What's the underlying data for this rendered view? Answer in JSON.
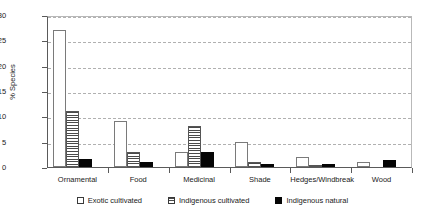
{
  "chart_data": {
    "type": "bar",
    "title": "",
    "xlabel": "",
    "ylabel": "% Species",
    "ylim": [
      0,
      30
    ],
    "ytick_step": 5,
    "yticks": [
      "0",
      "5",
      "10",
      "15",
      "20",
      "25",
      "30"
    ],
    "grid": "horizontal-dashed",
    "legend_position": "bottom-center",
    "categories": [
      "Ornamental",
      "Food",
      "Medicinal",
      "Shade",
      "Hedges/Windbreak",
      "Wood"
    ],
    "series": [
      {
        "name": "Exotic cultivated",
        "fill": "white-outline",
        "values": [
          27,
          9,
          3,
          5,
          2,
          1
        ]
      },
      {
        "name": "Indigenous cultivated",
        "fill": "horizontal-hatch",
        "values": [
          11,
          3,
          8,
          1,
          0.4,
          0
        ]
      },
      {
        "name": "Indigenous natural",
        "fill": "solid-black",
        "values": [
          1.5,
          1,
          3,
          0.5,
          0.5,
          1.3
        ]
      }
    ]
  },
  "colors": {
    "axis": "#5a5a5a",
    "grid": "#b0b0b0",
    "exotic_cultivated": "#ffffff",
    "indigenous_cultivated": "#4a4a4a",
    "indigenous_natural": "#050505",
    "text": "#1a1a1a",
    "background": "#ffffff"
  }
}
